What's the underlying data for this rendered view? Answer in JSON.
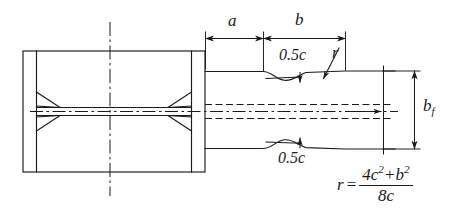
{
  "figure": {
    "kind": "engineering-drawing"
  },
  "dimensions": {
    "a_label": "a",
    "b_label": "b",
    "bf_symbol": "b",
    "bf_subscript": "f"
  },
  "annotations": {
    "half_c_top": "0.5c",
    "half_c_bottom": "0.5c",
    "radius_label": "r"
  },
  "formula": {
    "lhs": "r",
    "equals": "=",
    "numerator_1": "4c",
    "numerator_1_exp": "2",
    "plus": "+",
    "numerator_2": "b",
    "numerator_2_exp": "2",
    "denominator": "8c"
  },
  "colors": {
    "line": "#1a1a1a",
    "background": "#ffffff"
  }
}
